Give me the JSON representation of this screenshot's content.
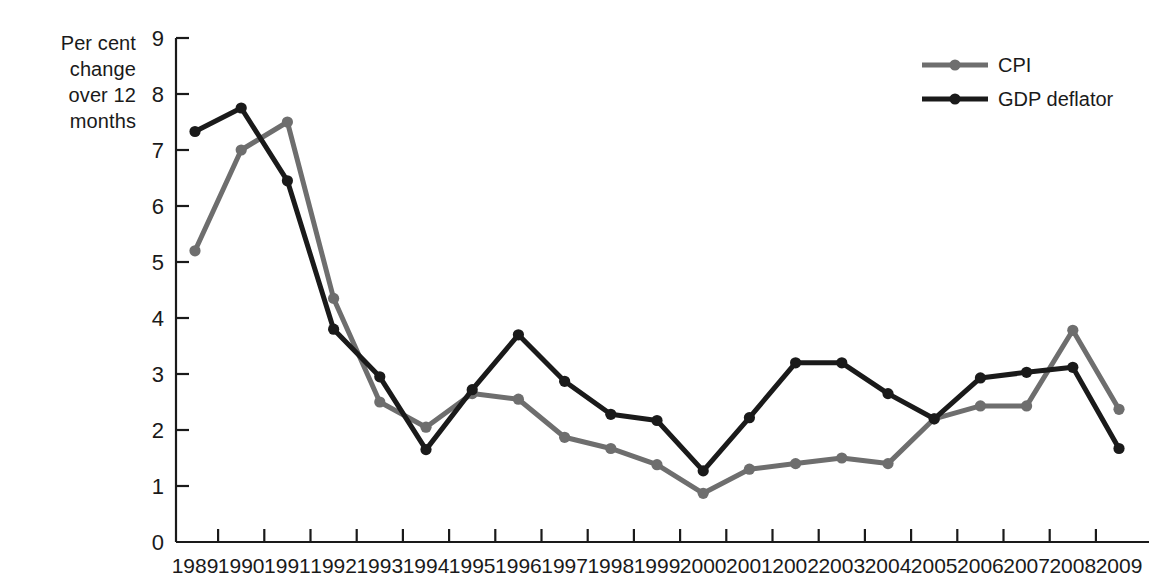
{
  "axis_caption": {
    "line1": "Per cent change",
    "line2": "over 12 months"
  },
  "legend": {
    "position": "top-right",
    "entries": [
      {
        "label": "CPI",
        "color": "#6e6e6e"
      },
      {
        "label": "GDP deflator",
        "color": "#1a1a1a"
      }
    ]
  },
  "chart_data": {
    "type": "line",
    "title": "",
    "xlabel": "",
    "ylabel": "Per cent change over 12 months",
    "ylim": [
      0,
      9
    ],
    "ytick_labels": [
      "0",
      "1",
      "2",
      "3",
      "4",
      "5",
      "6",
      "7",
      "8",
      "9"
    ],
    "yticks": [
      0,
      1,
      2,
      3,
      4,
      5,
      6,
      7,
      8,
      9
    ],
    "grid": false,
    "markers": true,
    "legend_position": "top-right",
    "categories": [
      "1989",
      "1990",
      "1991",
      "1992",
      "1993",
      "1994",
      "1995",
      "1996",
      "1997",
      "1998",
      "1999",
      "2000",
      "2001",
      "2002",
      "2003",
      "2004",
      "2005",
      "2006",
      "2007",
      "2008",
      "2009"
    ],
    "series": [
      {
        "name": "CPI",
        "color": "#6e6e6e",
        "values": [
          5.2,
          7.0,
          7.5,
          4.35,
          2.5,
          2.05,
          2.65,
          2.55,
          1.87,
          1.67,
          1.38,
          0.87,
          1.3,
          1.4,
          1.5,
          1.4,
          2.2,
          2.43,
          2.43,
          3.78,
          2.37
        ]
      },
      {
        "name": "GDP deflator",
        "color": "#1a1a1a",
        "values": [
          7.33,
          7.75,
          6.45,
          3.8,
          2.95,
          1.65,
          2.72,
          3.7,
          2.87,
          2.28,
          2.17,
          1.27,
          2.22,
          3.2,
          3.2,
          2.65,
          2.2,
          2.93,
          3.03,
          3.12,
          1.67
        ]
      }
    ]
  }
}
